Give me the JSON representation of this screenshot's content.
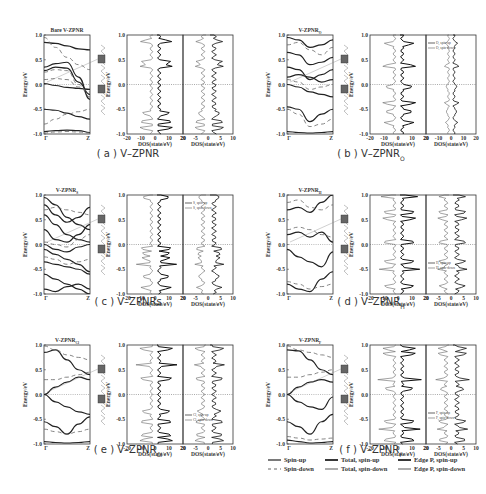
{
  "chart_data": [
    {
      "type": "line",
      "panel": "a",
      "caption": "( a ) V–ZPNR",
      "band_title": "Bare V-ZPNR",
      "band": {
        "ylabel": "Energy/eV",
        "ylim": [
          -1.0,
          1.0
        ],
        "yticks": [
          "1.0",
          "0.5",
          "0.0",
          "-0.5",
          "-1.0"
        ],
        "xticks": [
          "Γ",
          "Z"
        ],
        "spin_up": [
          [
            0.85,
            0.83,
            0.78,
            0.72,
            0.7
          ],
          [
            0.35,
            0.42,
            0.45,
            0.15,
            -0.3
          ],
          [
            0.28,
            0.35,
            0.33,
            0.05,
            -0.2
          ],
          [
            0.02,
            -0.02,
            -0.06,
            -0.08,
            -0.1
          ],
          [
            -0.5,
            -0.52,
            -0.58,
            -0.65,
            -0.7
          ],
          [
            -0.95,
            -0.93,
            -0.92,
            -0.93,
            -0.97
          ]
        ],
        "spin_down": [
          [
            0.95,
            0.75,
            0.55,
            0.4,
            0.3
          ],
          [
            0.25,
            0.3,
            0.28,
            0.0,
            -0.25
          ],
          [
            0.1,
            0.12,
            0.1,
            -0.05,
            -0.15
          ],
          [
            -0.8,
            -0.7,
            -0.6,
            -0.55,
            -0.5
          ],
          [
            -0.98,
            -0.96,
            -0.95,
            -0.96,
            -0.98
          ]
        ]
      },
      "dos_total": {
        "xlabel": "DOS(state/eV)",
        "xlim": [
          -20,
          20
        ],
        "xticks": [
          "-20",
          "-10",
          "0",
          "10",
          "20"
        ]
      },
      "dos_edge": {
        "xlabel": "DOS(state/eV)",
        "xlim": [
          -10,
          10
        ],
        "xticks": [
          "20",
          "-5",
          "0",
          "5",
          "10"
        ],
        "legend": []
      },
      "peaks": [
        0.88,
        0.45,
        0.38,
        -0.58,
        -0.75,
        -0.88
      ]
    },
    {
      "type": "line",
      "panel": "b",
      "caption": "( b ) V–ZPNR",
      "caption_sub": "O",
      "band_title": "V-ZPNR",
      "band_title_sub": "O",
      "band": {
        "ylabel": "Energy/eV",
        "ylim": [
          -1.0,
          1.0
        ],
        "yticks": [
          "1.0",
          "0.5",
          "0.0",
          "-0.5",
          "-1.0"
        ],
        "xticks": [
          "Γ",
          "Z"
        ],
        "spin_up": [
          [
            0.95,
            0.9,
            0.75,
            0.8,
            0.9
          ],
          [
            0.65,
            0.6,
            0.4,
            0.45,
            0.55
          ],
          [
            0.35,
            0.3,
            0.1,
            0.2,
            0.3
          ],
          [
            0.15,
            0.2,
            0.15,
            0.05,
            0.1
          ],
          [
            0.0,
            -0.05,
            -0.15,
            -0.2,
            -0.25
          ],
          [
            -0.45,
            -0.5,
            -0.75,
            -0.6,
            -0.5
          ],
          [
            -0.95,
            -0.97,
            -0.98,
            -0.97,
            -0.95
          ]
        ],
        "spin_down": [
          [
            0.8,
            0.85,
            0.7,
            0.6,
            0.75
          ],
          [
            0.1,
            0.05,
            -0.1,
            -0.05,
            0.0
          ],
          [
            -0.5,
            -0.6,
            -0.85,
            -0.8,
            -0.7
          ]
        ]
      },
      "dos_total": {
        "xlabel": "DOS(state/eV)",
        "xlim": [
          -20,
          20
        ],
        "xticks": [
          "-20",
          "-10",
          "0",
          "10",
          "20"
        ]
      },
      "dos_edge": {
        "xlabel": "DOS(state/eV)",
        "xlim": [
          -20,
          20
        ],
        "xticks": [
          "20",
          "-10",
          "0",
          "10",
          "20"
        ],
        "legend": [
          "O, spin-up",
          "O, spin-down"
        ]
      },
      "peaks": [
        0.82,
        0.38,
        -0.05,
        -0.38,
        -0.55,
        -0.78
      ]
    },
    {
      "type": "line",
      "panel": "c",
      "caption": "( c ) V–ZPNRs",
      "band_title": "V-ZPNR",
      "band_title_sub": "S",
      "band": {
        "ylabel": "Energy/eV",
        "ylim": [
          -1.0,
          1.0
        ],
        "yticks": [
          "1.0",
          "0.5",
          "0.0",
          "-0.5",
          "-1.0"
        ],
        "xticks": [
          "Γ",
          "Z"
        ],
        "spin_up": [
          [
            0.95,
            0.8,
            0.55,
            0.4,
            0.3
          ],
          [
            0.8,
            0.6,
            0.45,
            0.55,
            0.75
          ],
          [
            0.6,
            0.4,
            0.2,
            0.1,
            0.05
          ],
          [
            0.3,
            0.1,
            0.05,
            0.2,
            0.4
          ],
          [
            0.0,
            -0.1,
            -0.15,
            -0.05,
            0.0
          ],
          [
            -0.1,
            -0.2,
            -0.3,
            -0.4,
            -0.55
          ],
          [
            -0.35,
            -0.4,
            -0.45,
            -0.5,
            -0.6
          ],
          [
            -0.6,
            -0.7,
            -0.8,
            -0.9,
            -1.0
          ],
          [
            -0.9,
            -0.95,
            -0.85,
            -0.8,
            -0.9
          ]
        ],
        "spin_down": [
          [
            0.7,
            0.75,
            0.7,
            0.65,
            0.6
          ],
          [
            0.05,
            0.0,
            -0.05,
            0.1,
            0.2
          ],
          [
            -0.25,
            -0.3,
            -0.4,
            -0.35,
            -0.3
          ]
        ]
      },
      "dos_total": {
        "xlabel": "DOS(state/eV)",
        "xlim": [
          -20,
          20
        ],
        "xticks": [
          "-20",
          "-10",
          "0",
          "10",
          "20"
        ]
      },
      "dos_edge": {
        "xlabel": "DOS(state/eV)",
        "xlim": [
          -10,
          10
        ],
        "xticks": [
          "20",
          "-5",
          "0",
          "5",
          "10"
        ],
        "legend": [
          "S, spin-up",
          "S, spin-down"
        ]
      },
      "peaks": [
        0.95,
        -0.08,
        -0.18,
        -0.28,
        -0.4,
        -0.65,
        -0.88
      ]
    },
    {
      "type": "line",
      "panel": "d",
      "caption": "( d ) V–ZPNR",
      "caption_sub": "H",
      "band_title": "V-ZPNR",
      "band_title_sub": "H",
      "band": {
        "ylabel": "Energy/eV",
        "ylim": [
          -1.0,
          1.0
        ],
        "yticks": [
          "1.0",
          "0.5",
          "0.0",
          "-0.5",
          "-1.0"
        ],
        "xticks": [
          "Γ",
          "Z"
        ],
        "spin_up": [
          [
            0.7,
            0.75,
            0.65,
            0.85,
            1.0
          ],
          [
            0.2,
            0.25,
            0.15,
            0.25,
            0.05
          ],
          [
            -0.1,
            -0.25,
            -0.35,
            -0.45,
            -0.15
          ],
          [
            -0.8,
            -0.9,
            -0.95,
            -0.7,
            -0.55
          ]
        ],
        "spin_down": [
          [
            0.85,
            0.9,
            0.75,
            0.7,
            0.8
          ],
          [
            0.3,
            0.35,
            0.3,
            0.2,
            0.15
          ],
          [
            -0.75,
            -0.8,
            -0.9,
            -0.85,
            -0.8
          ]
        ]
      },
      "dos_total": {
        "xlabel": "DOS(state/eV)",
        "xlim": [
          -20,
          20
        ],
        "xticks": [
          "-20",
          "-10",
          "0",
          "10",
          "20"
        ]
      },
      "dos_edge": {
        "xlabel": "DOS(state/eV)",
        "xlim": [
          -10,
          10
        ],
        "xticks": [
          "20",
          "-5",
          "0",
          "5",
          "10"
        ],
        "legend": [
          "H, spin-up",
          "H, spin-down"
        ]
      },
      "peaks": [
        0.97,
        0.65,
        0.52,
        0.05,
        -0.35,
        -0.5,
        -0.85
      ]
    },
    {
      "type": "line",
      "panel": "e",
      "caption": "( e ) V–ZPNR",
      "caption_sub": "Cl",
      "band_title": "V-ZPNR",
      "band_title_sub": "Cl",
      "band": {
        "ylabel": "Energy/eV",
        "ylim": [
          -1.0,
          1.0
        ],
        "yticks": [
          "1.0",
          "0.5",
          "0.0",
          "-0.5",
          "-1.0"
        ],
        "xticks": [
          "Γ",
          "Z"
        ],
        "spin_up": [
          [
            0.85,
            0.9,
            0.7,
            0.5,
            0.4
          ],
          [
            0.0,
            0.15,
            0.25,
            0.35,
            0.3
          ],
          [
            0.0,
            -0.15,
            -0.25,
            -0.35,
            -0.4
          ],
          [
            -0.55,
            -0.65,
            -0.8,
            -0.6,
            -0.45
          ],
          [
            -0.95,
            -0.97,
            -0.98,
            -0.97,
            -0.95
          ]
        ],
        "spin_down": [
          [
            0.98,
            0.9,
            0.8,
            0.75,
            0.7
          ],
          [
            0.3,
            0.3,
            0.35,
            0.4,
            0.45
          ],
          [
            -0.7,
            -0.75,
            -0.8,
            -0.75,
            -0.7
          ]
        ]
      },
      "dos_total": {
        "xlabel": "DOS(state/eV)",
        "xlim": [
          -20,
          20
        ],
        "xticks": [
          "-20",
          "-10",
          "0",
          "10",
          "20"
        ]
      },
      "dos_edge": {
        "xlabel": "DOS(state/eV)",
        "xlim": [
          -10,
          10
        ],
        "xticks": [
          "20",
          "-5",
          "0",
          "5",
          "10"
        ],
        "legend": [
          "Cl, spin-up",
          "Cl, spin-down"
        ]
      },
      "peaks": [
        0.92,
        0.6,
        0.32,
        -0.35,
        -0.55,
        -0.82,
        -0.92
      ]
    },
    {
      "type": "line",
      "panel": "f",
      "caption": "( f ) V–ZPNR",
      "caption_sub": "F",
      "band_title": "V-ZPNR",
      "band_title_sub": "F",
      "band": {
        "ylabel": "Energy/eV",
        "ylim": [
          -1.0,
          1.0
        ],
        "yticks": [
          "1.0",
          "0.5",
          "0.0",
          "-0.5",
          "-1.0"
        ],
        "xticks": [
          "Γ",
          "Z"
        ],
        "spin_up": [
          [
            0.9,
            0.88,
            0.7,
            0.5,
            0.4
          ],
          [
            0.0,
            0.15,
            0.25,
            0.3,
            0.25
          ],
          [
            0.0,
            -0.15,
            -0.25,
            -0.3,
            -0.05
          ],
          [
            -0.55,
            -0.65,
            -0.8,
            -0.55,
            -0.4
          ],
          [
            -0.92,
            -0.95,
            -0.98,
            -0.97,
            -0.95
          ]
        ],
        "spin_down": [
          [
            0.98,
            0.9,
            0.85,
            0.8,
            0.75
          ],
          [
            0.35,
            0.35,
            0.4,
            0.45,
            0.5
          ],
          [
            -0.85,
            -0.88,
            -0.92,
            -0.9,
            -0.88
          ]
        ]
      },
      "dos_total": {
        "xlabel": "DOS(state/eV)",
        "xlim": [
          -20,
          20
        ],
        "xticks": [
          "-20",
          "-10",
          "0",
          "10",
          "20"
        ]
      },
      "dos_edge": {
        "xlabel": "DOS(state/eV)",
        "xlim": [
          -10,
          10
        ],
        "xticks": [
          "20",
          "-5",
          "0",
          "5",
          "10"
        ],
        "legend": [
          "F, spin-up",
          "F, spin-down"
        ]
      },
      "peaks": [
        0.92,
        0.82,
        0.3,
        0.12,
        -0.55,
        -0.7,
        -0.92
      ]
    }
  ],
  "legend": {
    "items": [
      {
        "label": "Spin-up",
        "style": "solid-thin"
      },
      {
        "label": "Spin-down",
        "style": "dashed"
      },
      {
        "label": "Total, spin-up",
        "style": "solid-thick"
      },
      {
        "label": "Total, spin-down",
        "style": "solid-gray"
      },
      {
        "label": "Edge P, spin-up",
        "style": "solid-thick"
      },
      {
        "label": "Edge P, spin-down",
        "style": "solid-gray"
      }
    ]
  }
}
